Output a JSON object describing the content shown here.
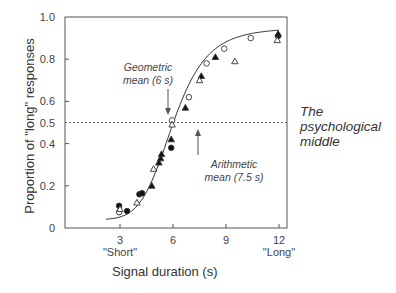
{
  "chart_data": {
    "type": "scatter",
    "title": "",
    "xlabel": "Signal duration (s)",
    "ylabel": "Proportion of \"long\" responses",
    "xlim": [
      0,
      12.5
    ],
    "ylim": [
      0,
      1.0
    ],
    "grid": false,
    "x_ticks": [
      3,
      6,
      9,
      12
    ],
    "x_tick_labels": [
      "3",
      "6",
      "9",
      "12"
    ],
    "x_tick_sublabels": [
      "\"Short\"",
      "",
      "",
      "\"Long\""
    ],
    "y_ticks": [
      0,
      0.2,
      0.4,
      0.5,
      0.6,
      0.8,
      1.0
    ],
    "y_tick_labels": [
      "0",
      "0.2",
      "0.4",
      "0.5",
      "0.6",
      "0.8",
      "1.0"
    ],
    "reference_line": {
      "y": 0.5,
      "style": "dotted",
      "label": "The psychological middle"
    },
    "annotations": [
      {
        "text": "Geometric mean (6 s)",
        "x": 6,
        "arrow": "down"
      },
      {
        "text": "Arithmetic mean (7.5 s)",
        "x": 7.5,
        "arrow": "up"
      }
    ],
    "series": [
      {
        "name": "filled circles",
        "marker": "filled-circle",
        "points": [
          [
            2.95,
            0.105
          ],
          [
            3.4,
            0.08
          ],
          [
            4.1,
            0.16
          ],
          [
            4.25,
            0.165
          ],
          [
            5.9,
            0.38
          ],
          [
            11.95,
            0.91
          ]
        ]
      },
      {
        "name": "open circles",
        "marker": "open-circle",
        "points": [
          [
            2.95,
            0.075
          ],
          [
            5.95,
            0.51
          ],
          [
            6.9,
            0.62
          ],
          [
            7.9,
            0.78
          ],
          [
            8.9,
            0.85
          ],
          [
            10.4,
            0.9
          ]
        ]
      },
      {
        "name": "filled triangles",
        "marker": "filled-triangle",
        "points": [
          [
            4.8,
            0.2
          ],
          [
            5.2,
            0.31
          ],
          [
            5.3,
            0.33
          ],
          [
            5.35,
            0.35
          ],
          [
            5.9,
            0.42
          ],
          [
            6.7,
            0.57
          ],
          [
            7.6,
            0.72
          ],
          [
            8.4,
            0.81
          ],
          [
            11.95,
            0.92
          ]
        ]
      },
      {
        "name": "open triangles",
        "marker": "open-triangle",
        "points": [
          [
            3.0,
            0.09
          ],
          [
            3.96,
            0.12
          ],
          [
            4.9,
            0.28
          ],
          [
            5.95,
            0.49
          ],
          [
            7.5,
            0.7
          ],
          [
            9.5,
            0.79
          ],
          [
            11.9,
            0.89
          ]
        ]
      }
    ],
    "fit_curve": {
      "type": "sigmoid",
      "midpoint": 6,
      "lower": 0.04,
      "upper": 0.95
    }
  },
  "labels": {
    "ylabel": "Proportion of \"long\" responses",
    "xlabel": "Signal duration (s)",
    "short": "\"Short\"",
    "long": "\"Long\"",
    "geo1": "Geometric",
    "geo2": "mean (6 s)",
    "ari1": "Arithmetic",
    "ari2": "mean (7.5 s)",
    "side1": "The",
    "side2": "psychological",
    "side3": "middle"
  }
}
